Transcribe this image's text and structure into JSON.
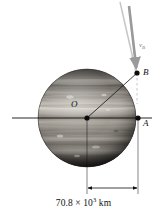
{
  "figure": {
    "body_name": "Jupiter",
    "labels": {
      "center": "O",
      "point_a": "A",
      "point_b": "B",
      "velocity": "v",
      "velocity_sub": "B"
    },
    "dimension": {
      "value": "70.8 × 10",
      "exponent": "3",
      "unit": " km",
      "full_text": "70.8 × 10³ km"
    },
    "colors": {
      "line": "#111111",
      "arrow": "#9a9a9a",
      "trajectory": "#bdbdbd",
      "planet_dark": "#3a3a3a",
      "planet_light": "#d8d4cc",
      "background": "#ffffff"
    },
    "geometry": {
      "center_x": 87,
      "center_y": 118,
      "radius": 49,
      "point_a_x": 138,
      "point_a_y": 118,
      "point_b_x": 137,
      "point_b_y": 73,
      "dim_left_x": 87,
      "dim_right_x": 138,
      "dim_y": 188
    }
  }
}
